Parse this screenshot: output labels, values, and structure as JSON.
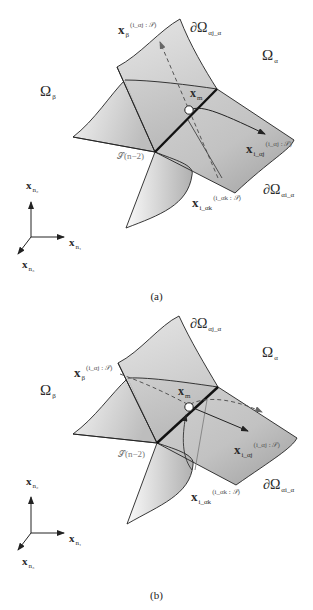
{
  "figure": {
    "panels": [
      {
        "id": "a",
        "caption": "(a)",
        "labels": {
          "omega_alpha": {
            "main": "Ω",
            "sub": "α"
          },
          "omega_beta": {
            "main": "Ω",
            "sub": "β"
          },
          "boundary_top": {
            "main": "∂Ω",
            "sub": "αj_α"
          },
          "boundary_right": {
            "main": "∂Ω",
            "sub": "αi_α"
          },
          "x_beta": {
            "main": "x",
            "sub": "β",
            "sup": "(i_αj : 𝒮)"
          },
          "x_m": {
            "main": "x",
            "sub": "m"
          },
          "x_right": {
            "main": "x",
            "sub": "i_αj",
            "sup": "(i_αj : 𝒮)"
          },
          "x_bottom": {
            "main": "x",
            "sub": "i_αk",
            "sup": "(i_αk : 𝒮)"
          },
          "edge": {
            "main": "𝒮",
            "sup": "(n−2)"
          }
        }
      },
      {
        "id": "b",
        "caption": "(b)",
        "labels": {
          "omega_alpha": {
            "main": "Ω",
            "sub": "α"
          },
          "omega_beta": {
            "main": "Ω",
            "sub": "β"
          },
          "boundary_top": {
            "main": "∂Ω",
            "sub": "αj_α"
          },
          "boundary_right": {
            "main": "∂Ω",
            "sub": "αi_α"
          },
          "x_beta": {
            "main": "x",
            "sub": "β",
            "sup": "(i_αj : 𝒮)"
          },
          "x_m": {
            "main": "x",
            "sub": "m"
          },
          "x_right": {
            "main": "x",
            "sub": "i_αj",
            "sup": "(i_αj : 𝒮)"
          },
          "x_bottom": {
            "main": "x",
            "sub": "i_αk",
            "sup": "(i_αk : 𝒮)"
          },
          "edge": {
            "main": "𝒮",
            "sup": "(n−2)"
          }
        }
      }
    ],
    "axes": {
      "x1": {
        "main": "x",
        "sub": "n₁"
      },
      "x2": {
        "main": "x",
        "sub": "n₂"
      },
      "x3": {
        "main": "x",
        "sub": "n₃"
      }
    }
  },
  "colors": {
    "stroke": "#222222",
    "surface_light": "#f4f4f4",
    "surface_dark": "#a8a8a8",
    "dashed": "#555555"
  }
}
